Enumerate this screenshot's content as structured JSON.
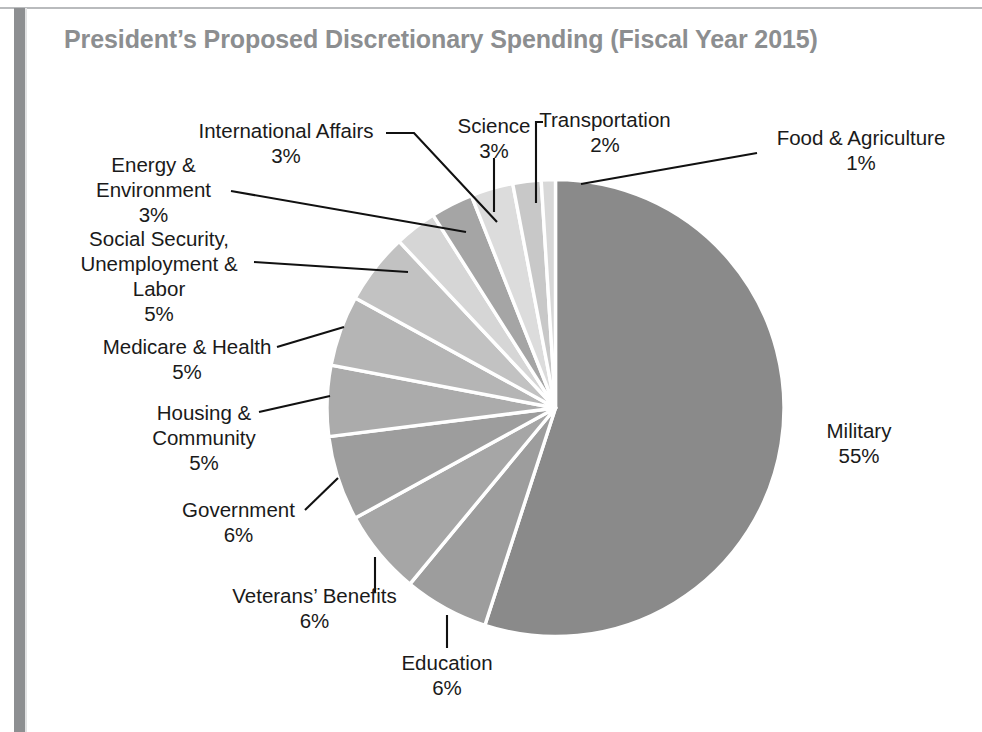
{
  "chart_title": "President’s Proposed Discretionary Spending (Fiscal Year 2015)",
  "colors": {
    "military": "#8a8a8a",
    "slice_dark": "#9d9d9d",
    "slice_mid": "#b3b3b3",
    "slice_light": "#d2d2d2",
    "slice_lightest": "#e0e0e0",
    "title_text": "#8c8e90",
    "label_text": "#1a1a1a",
    "leader_line": "#111111",
    "slice_gap": "#ffffff",
    "page_spine": "#8d8f91",
    "page_rule": "#b9bbbd"
  },
  "chart_data": {
    "type": "pie",
    "title": "President’s Proposed Discretionary Spending (Fiscal Year 2015)",
    "subtitle": "",
    "xlabel": "",
    "ylabel": "",
    "legend": "none (direct callout labels)",
    "grid": false,
    "units": "percent of discretionary budget",
    "start_angle_deg": 0,
    "direction": "clockwise",
    "categories": [
      "Military",
      "Education",
      "Veterans’ Benefits",
      "Government",
      "Housing & Community",
      "Medicare & Health",
      "Social Security, Unemployment & Labor",
      "Energy & Environment",
      "International Affairs",
      "Science",
      "Transportation",
      "Food & Agriculture"
    ],
    "values": [
      55,
      6,
      6,
      6,
      5,
      5,
      5,
      3,
      3,
      3,
      2,
      1
    ],
    "slices": [
      {
        "label": "Military",
        "pct": 55,
        "pct_text": "55%",
        "color": "#8a8a8a"
      },
      {
        "label": "Education",
        "pct": 6,
        "pct_text": "6%",
        "color": "#9d9d9d"
      },
      {
        "label": "Veterans’ Benefits",
        "pct": 6,
        "pct_text": "6%",
        "color": "#a6a6a6"
      },
      {
        "label": "Government",
        "pct": 6,
        "pct_text": "6%",
        "color": "#9d9d9d"
      },
      {
        "label": "Housing & Community",
        "pct": 5,
        "pct_text": "5%",
        "color": "#ababab"
      },
      {
        "label": "Medicare & Health",
        "pct": 5,
        "pct_text": "5%",
        "color": "#b5b5b5"
      },
      {
        "label": "Social Security, Unemployment & Labor",
        "pct": 5,
        "pct_text": "5%",
        "color": "#c2c2c2"
      },
      {
        "label": "Energy & Environment",
        "pct": 3,
        "pct_text": "3%",
        "color": "#d6d6d6"
      },
      {
        "label": "International Affairs",
        "pct": 3,
        "pct_text": "3%",
        "color": "#a5a5a5"
      },
      {
        "label": "Science",
        "pct": 3,
        "pct_text": "3%",
        "color": "#dcdcdc"
      },
      {
        "label": "Transportation",
        "pct": 2,
        "pct_text": "2%",
        "color": "#c8c8c8"
      },
      {
        "label": "Food & Agriculture",
        "pct": 1,
        "pct_text": "1%",
        "color": "#d8d8d8"
      }
    ]
  },
  "callouts": [
    {
      "key": "international_affairs",
      "name": "International Affairs",
      "pct": "3%"
    },
    {
      "key": "science",
      "name": "Science",
      "pct": "3%"
    },
    {
      "key": "transportation",
      "name": "Transportation",
      "pct": "2%"
    },
    {
      "key": "food_agriculture",
      "name": "Food & Agriculture",
      "pct": "1%"
    },
    {
      "key": "energy_environment",
      "name": "Energy & Environment",
      "pct": "3%"
    },
    {
      "key": "social_security",
      "name": "Social Security, Unemployment & Labor",
      "pct": "5%"
    },
    {
      "key": "medicare_health",
      "name": "Medicare & Health",
      "pct": "5%"
    },
    {
      "key": "housing_community",
      "name": "Housing & Community",
      "pct": "5%"
    },
    {
      "key": "government",
      "name": "Government",
      "pct": "6%"
    },
    {
      "key": "veterans_benefits",
      "name": "Veterans’ Benefits",
      "pct": "6%"
    },
    {
      "key": "education",
      "name": "Education",
      "pct": "6%"
    },
    {
      "key": "military",
      "name": "Military",
      "pct": "55%"
    }
  ],
  "labels": {
    "international_affairs_l1": "International Affairs",
    "international_affairs_pct": "3%",
    "science_l1": "Science",
    "science_pct": "3%",
    "transportation_l1": "Transportation",
    "transportation_pct": "2%",
    "food_l1": "Food & Agriculture",
    "food_pct": "1%",
    "energy_l1": "Energy &",
    "energy_l2": "Environment",
    "energy_pct": "3%",
    "ssa_l1": "Social Security,",
    "ssa_l2": "Unemployment &",
    "ssa_l3": "Labor",
    "ssa_pct": "5%",
    "medicare_l1": "Medicare & Health",
    "medicare_pct": "5%",
    "housing_l1": "Housing &",
    "housing_l2": "Community",
    "housing_pct": "5%",
    "government_l1": "Government",
    "government_pct": "6%",
    "veterans_l1": "Veterans’ Benefits",
    "veterans_pct": "6%",
    "education_l1": "Education",
    "education_pct": "6%",
    "military_l1": "Military",
    "military_pct": "55%"
  }
}
